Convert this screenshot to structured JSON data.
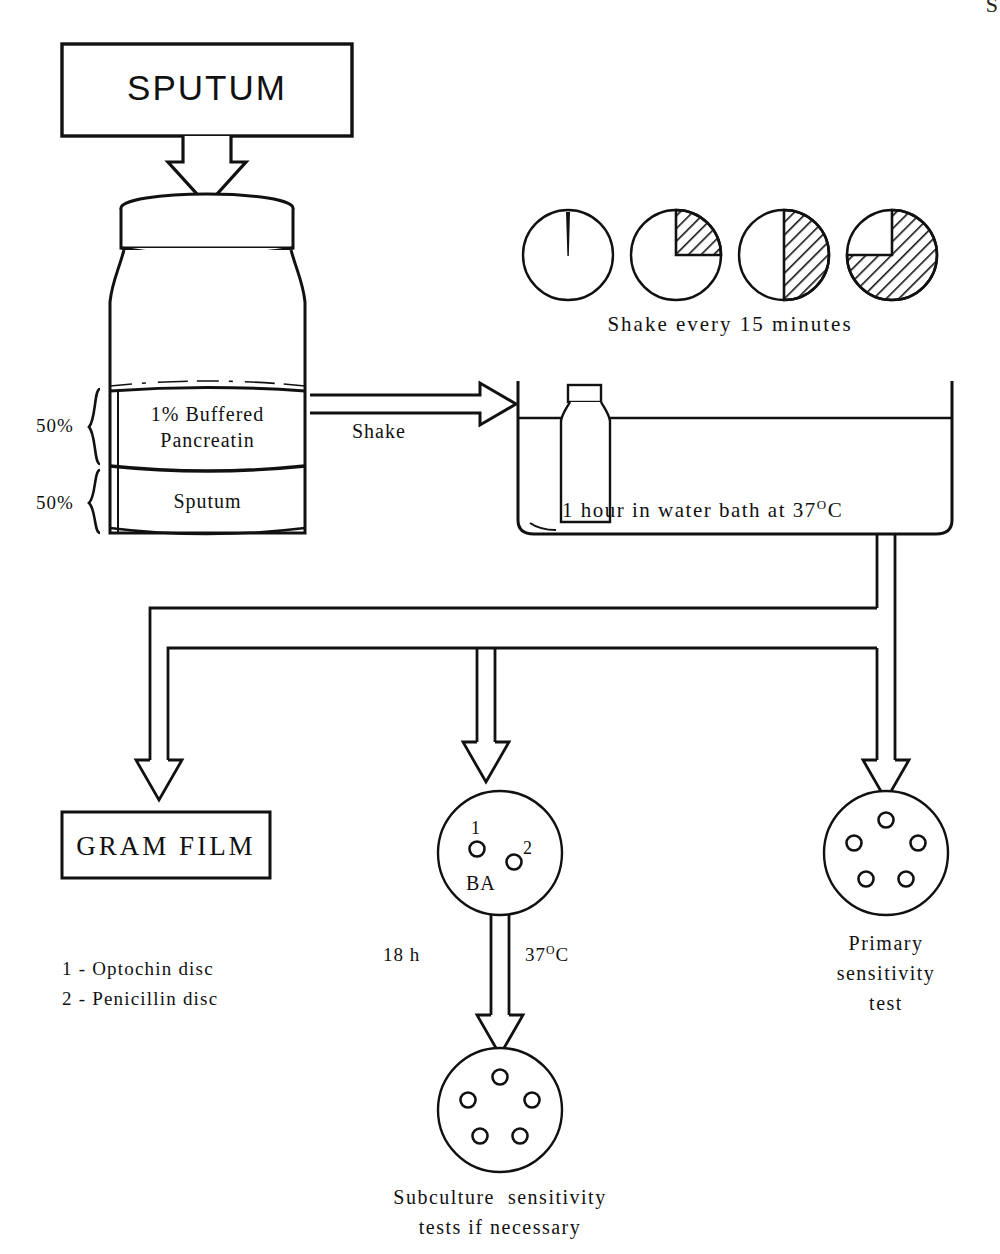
{
  "diagram": {
    "title_box": {
      "label": "SPUTUM"
    },
    "jar": {
      "upper_layer_line1": "1% Buffered",
      "upper_layer_line2": "Pancreatin",
      "lower_layer": "Sputum",
      "upper_pct": "50%",
      "lower_pct": "50%"
    },
    "shake_arrow": {
      "label": "Shake"
    },
    "clocks": {
      "caption": "Shake every 15 minutes",
      "steps": [
        {
          "name": "clock-0",
          "fill_fraction": 0,
          "hatched": false
        },
        {
          "name": "clock-15",
          "fill_fraction": 0.25,
          "hatched": true
        },
        {
          "name": "clock-30",
          "fill_fraction": 0.5,
          "hatched": true
        },
        {
          "name": "clock-45",
          "fill_fraction": 0.75,
          "hatched": true
        }
      ]
    },
    "water_bath": {
      "caption_pre": "1 hour in water bath at 37",
      "caption_sup": "O",
      "caption_post": "C"
    },
    "outputs": {
      "gram_film": {
        "label": "GRAM FILM"
      },
      "ba_plate": {
        "label": "BA",
        "disc1": "1",
        "disc2": "2"
      },
      "primary_plate": {
        "caption_line1": "Primary",
        "caption_line2": "sensitivity",
        "caption_line3": "test",
        "disc_count": 5
      },
      "subculture_plate": {
        "caption_line1": "Subculture  sensitivity",
        "caption_line2": "tests if necessary",
        "disc_count": 5
      }
    },
    "incubation": {
      "time_label": "18 h",
      "temp_pre": "37",
      "temp_sup": "O",
      "temp_post": "C"
    },
    "legend": [
      "1 - Optochin disc",
      "2 - Penicillin disc"
    ],
    "corner_mark": "S",
    "colors": {
      "ink": "#111111",
      "paper": "#ffffff"
    }
  }
}
